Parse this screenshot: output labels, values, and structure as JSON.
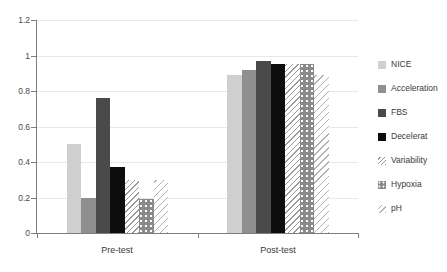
{
  "chart_data": {
    "type": "bar",
    "title": "",
    "subtitle": "",
    "xlabel": "",
    "ylabel": "",
    "categories": [
      "Pre-test",
      "Post-test"
    ],
    "ylim": [
      0,
      1.2
    ],
    "yticks": [
      "0",
      "0.2",
      "0.4",
      "0.6",
      "0.8",
      "1",
      "1.2"
    ],
    "ytick_values": [
      0,
      0.2,
      0.4,
      0.6,
      0.8,
      1,
      1.2
    ],
    "grid": true,
    "legend_position": "right",
    "series": [
      {
        "name": "NICE",
        "values": [
          0.5,
          0.89
        ],
        "style": "solid",
        "color": "#cfcfcf"
      },
      {
        "name": "Acceleration",
        "values": [
          0.2,
          0.92
        ],
        "style": "solid",
        "color": "#8f8f8f"
      },
      {
        "name": "FBS",
        "values": [
          0.76,
          0.97
        ],
        "style": "solid",
        "color": "#4a4a4a"
      },
      {
        "name": "Decelerat",
        "values": [
          0.37,
          0.95
        ],
        "style": "solid",
        "color": "#0d0d0d"
      },
      {
        "name": "Variability",
        "values": [
          0.3,
          0.95
        ],
        "style": "hatch",
        "color": "#9a9a9a"
      },
      {
        "name": "Hypoxia",
        "values": [
          0.19,
          0.95
        ],
        "style": "dots",
        "color": "#8a8a8a"
      },
      {
        "name": "pH",
        "values": [
          0.3,
          0.89
        ],
        "style": "hatch-light",
        "color": "#b2b2b2"
      }
    ]
  },
  "axis": {
    "y_labels": [
      "1.2",
      "1",
      "0.8",
      "0.6",
      "0.4",
      "0.2",
      "0"
    ],
    "x_labels": [
      "Pre-test",
      "Post-test"
    ]
  },
  "legend": {
    "items": [
      {
        "label": "NICE"
      },
      {
        "label": "Acceleration"
      },
      {
        "label": "FBS"
      },
      {
        "label": "Decelerat"
      },
      {
        "label": "Variability"
      },
      {
        "label": "Hypoxia"
      },
      {
        "label": "pH"
      }
    ]
  }
}
